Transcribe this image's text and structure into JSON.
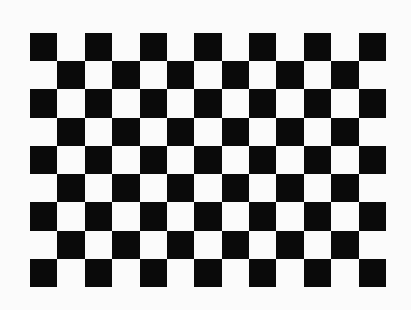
{
  "image": {
    "description": "Checkerboard calibration pattern",
    "background_color": "#fbfbfb"
  },
  "board": {
    "columns": 13,
    "rows": 9,
    "first_cell_color": "black",
    "colors": {
      "black": "#0a0a0a",
      "white": "#fbfbfb"
    },
    "position": {
      "left": 30,
      "top": 33,
      "width": 356,
      "height": 254
    }
  }
}
